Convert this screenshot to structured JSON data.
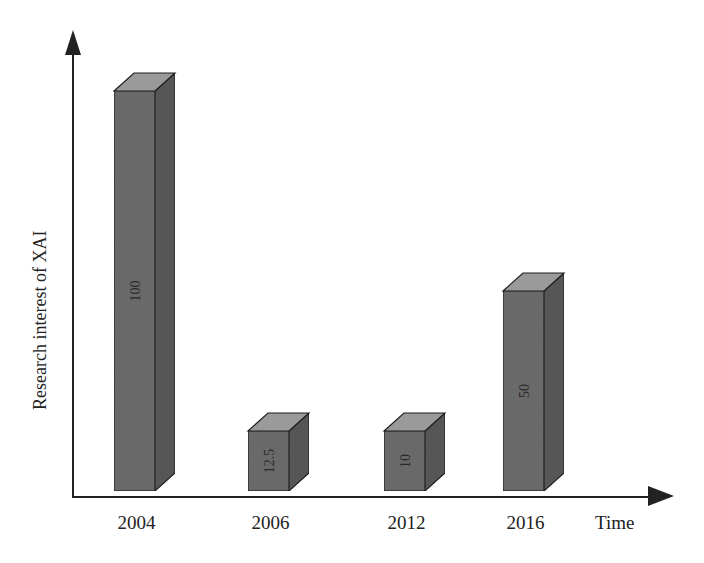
{
  "chart_data": {
    "type": "bar",
    "style": "3d-bar",
    "title": "",
    "xlabel": "Time",
    "ylabel": "Research interest of XAI",
    "categories": [
      "2004",
      "2006",
      "2012",
      "2016"
    ],
    "values": [
      100,
      12.5,
      10,
      50
    ],
    "value_labels": [
      "100",
      "12.5",
      "10",
      "50"
    ],
    "ylim": [
      0,
      100
    ],
    "grid": false,
    "legend": null,
    "axes": {
      "y_arrow": true,
      "x_arrow": true,
      "y_ticks": false
    },
    "colors": {
      "front": "#6b6b6b",
      "side": "#585858",
      "top": "#9a9a9a",
      "edge": "#1e1e1e",
      "axis": "#222222"
    }
  },
  "axis": {
    "x_label": "Time",
    "y_label": "Research interest of XAI"
  }
}
